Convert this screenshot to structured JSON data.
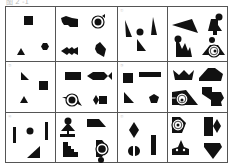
{
  "figure": {
    "title": "图 2 -1",
    "rows": 3,
    "cols": 4,
    "cells": [
      {
        "id": "r1c1",
        "label": "",
        "desc": "square, triangle, hexagon"
      },
      {
        "id": "r1c2",
        "label": "",
        "desc": "blob shape, ringed circle, fish, curved band"
      },
      {
        "id": "r1c3",
        "label": "①",
        "desc": "two tall triangles, circle, right triangle"
      },
      {
        "id": "r1c4",
        "label": "",
        "desc": "kite, person shape, spiky shape, ringed target"
      },
      {
        "id": "r2c1",
        "label": "②",
        "desc": "right triangle, square, triangle"
      },
      {
        "id": "r2c2",
        "label": "",
        "desc": "rectangle, fish, ringed triangle, diamond-square"
      },
      {
        "id": "r2c3",
        "label": "③",
        "desc": "square, long bar, right triangle, pentagon"
      },
      {
        "id": "r2c4",
        "label": "",
        "desc": "crown, square-hexagon, ringed slab, puzzle pieces"
      },
      {
        "id": "r3c1",
        "label": "④",
        "desc": "bar, circle, bar, right triangle"
      },
      {
        "id": "r3c2",
        "label": "",
        "desc": "tree-figure, trapezoid, stepped shape, ringed circle"
      },
      {
        "id": "r3c3",
        "label": "⑤",
        "desc": "diamond, bar, split circle"
      },
      {
        "id": "r3c4",
        "label": "",
        "desc": "ringed D, rectangle-diamond, crown, heart"
      }
    ]
  },
  "colors": {
    "ink": "#111111",
    "grid": "#555555",
    "bg": "#ffffff"
  }
}
